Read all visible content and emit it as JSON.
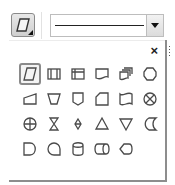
{
  "toolbar": {
    "shape_button": {
      "icon": "parallelogram-icon",
      "has_dropdown_indicator": true
    },
    "line_style_dropdown": {
      "selected_value": "solid-line",
      "arrow": "chevron-down-icon"
    }
  },
  "panel": {
    "close_label": "×",
    "drag_handle": "grip-icon",
    "selected_shape": "parallelogram",
    "shapes": [
      [
        "parallelogram",
        "predefined-process",
        "internal-storage",
        "document",
        "multi-document",
        "preparation"
      ],
      [
        "manual-input",
        "manual-operation",
        "off-page-connector",
        "card",
        "punched-tape",
        "summing-junction"
      ],
      [
        "or",
        "collate",
        "sort",
        "extract",
        "merge",
        "stored-data"
      ],
      [
        "delay",
        "sequential-access-storage",
        "magnetic-disk",
        "direct-access-storage",
        "display"
      ]
    ]
  },
  "colors": {
    "stroke": "#4a4a4a",
    "border": "#8d8d8d",
    "selected_bg": "#f4f4f4"
  }
}
